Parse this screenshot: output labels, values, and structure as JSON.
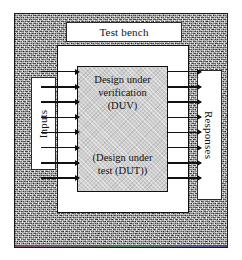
{
  "diagram": {
    "title": "Test bench",
    "outer_frame": {
      "name": "environment",
      "fill": "#a9a9a9",
      "border_color": "#1a1a1a"
    },
    "testbench_box": {
      "label": "Test bench",
      "fill": "#ffffff",
      "border_color": "#111111"
    },
    "duv_box": {
      "fill": "#cfcfcf",
      "border_color": "#111111",
      "primary_lines": [
        "Design under",
        "verification",
        "(DUV)"
      ],
      "alternate_lines": [
        "(Design under",
        "test (DUT))"
      ]
    },
    "left_label": {
      "text": "Inputs",
      "orientation": "rotated-90-ccw",
      "fill": "#ffffff"
    },
    "right_label": {
      "text": "Responses",
      "orientation": "rotated-90-cw",
      "fill": "#ffffff"
    },
    "arrows": {
      "left_count": 8,
      "right_count": 8,
      "direction": "left-to-right",
      "color": "#111111",
      "left_meaning": "stimulus into DUV",
      "right_meaning": "responses out of DUV"
    },
    "bottom_fringe": {
      "present": true,
      "description": "thin colored scan artifact line"
    }
  }
}
